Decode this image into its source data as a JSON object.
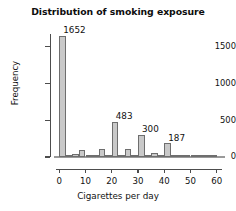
{
  "chart_data": {
    "type": "bar",
    "title": "Distribution of smoking exposure",
    "xlabel": "Cigarettes per day",
    "ylabel": "Frequency",
    "xlim": [
      -2,
      62
    ],
    "ylim": [
      0,
      1700
    ],
    "grid": false,
    "legend": null,
    "bin_width": 2.5,
    "bar_fill": "#c9c9c9",
    "bar_edge": "#6e6e6e",
    "x_ticks": [
      0,
      10,
      20,
      30,
      40,
      50,
      60
    ],
    "x_tick_labels": [
      "0",
      "10",
      "20",
      "30",
      "40",
      "50",
      "60"
    ],
    "y_ticks": [
      0,
      500,
      1000,
      1500
    ],
    "y_tick_labels": [
      "0",
      "500",
      "1000",
      "1500"
    ],
    "categories": [
      0,
      2.5,
      5,
      7.5,
      10,
      12.5,
      15,
      17.5,
      20,
      22.5,
      25,
      27.5,
      30,
      32.5,
      35,
      37.5,
      40,
      42.5,
      45,
      47.5,
      50,
      52.5,
      55,
      57.5
    ],
    "values": [
      1652,
      30,
      45,
      90,
      22,
      12,
      115,
      24,
      483,
      18,
      110,
      14,
      300,
      8,
      52,
      6,
      187,
      5,
      20,
      34,
      4,
      2,
      1,
      1
    ],
    "annotations": [
      {
        "text": "1652",
        "x": 0,
        "value": 1652
      },
      {
        "text": "483",
        "x": 20,
        "value": 483
      },
      {
        "text": "300",
        "x": 30,
        "value": 300
      },
      {
        "text": "187",
        "x": 40,
        "value": 187
      }
    ]
  },
  "labels": {
    "annotation_0": "1652",
    "annotation_1": "483",
    "annotation_2": "300",
    "annotation_3": "187"
  }
}
